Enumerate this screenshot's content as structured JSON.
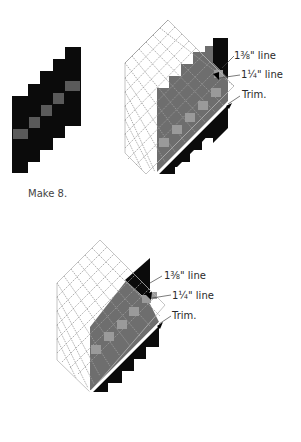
{
  "figure": {
    "step1": {
      "caption": "Make 8.",
      "colors": {
        "dark": "#0b0b0b",
        "accent": "#5a5a5a"
      }
    },
    "step2": {
      "labels": {
        "line_1": "1⅜\" line",
        "line_2": "1¼\" line",
        "trim": "Trim."
      }
    },
    "step3": {
      "labels": {
        "line_1": "1⅜\" line",
        "line_2": "1¼\" line",
        "trim": "Trim."
      }
    },
    "colors": {
      "black": "#0b0b0b",
      "gray_fabric": "#6e6e6e",
      "light_square": "#9a9a9a",
      "ruler_grid": "#9c9c9c",
      "trim_line": "#ffffff"
    }
  }
}
